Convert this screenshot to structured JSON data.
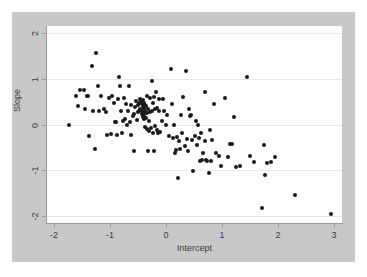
{
  "chart_data": {
    "type": "scatter",
    "title": "",
    "xlabel": "Intercept",
    "ylabel": "Slope",
    "xlim": [
      -2.15,
      3.15
    ],
    "ylim": [
      -2.15,
      2.15
    ],
    "xticks": [
      -2,
      -1,
      0,
      1,
      2,
      3
    ],
    "xticklabels": [
      "-2",
      "-1",
      "0",
      "1",
      "2",
      "3"
    ],
    "yticks": [
      2,
      1,
      0,
      -1,
      -2
    ],
    "yticklabels": [
      "2",
      "1",
      "0",
      "-1",
      "-2"
    ],
    "grid": "horizontal",
    "gridlines_y": [
      2,
      1,
      0,
      -1,
      -2
    ],
    "legend": "none",
    "marker": {
      "shape": "circle",
      "color": "#1a1a1a",
      "size": 4
    },
    "n_points": 158,
    "series": [
      {
        "name": "units",
        "points": [
          [
            -1.74,
            0.0
          ],
          [
            -1.62,
            0.62
          ],
          [
            -1.58,
            0.41
          ],
          [
            -1.55,
            0.76
          ],
          [
            -1.47,
            0.75
          ],
          [
            -1.45,
            0.33
          ],
          [
            -1.42,
            0.63
          ],
          [
            -1.4,
            0.62
          ],
          [
            -1.38,
            -0.26
          ],
          [
            -1.33,
            1.27
          ],
          [
            -1.3,
            0.3
          ],
          [
            -1.28,
            -0.53
          ],
          [
            -1.25,
            1.55
          ],
          [
            -1.22,
            0.85
          ],
          [
            -1.2,
            0.29
          ],
          [
            -1.16,
            0.63
          ],
          [
            -1.12,
            0.33
          ],
          [
            -1.08,
            0.28
          ],
          [
            -1.05,
            -0.23
          ],
          [
            -1.02,
            0.57
          ],
          [
            -0.99,
            -0.2
          ],
          [
            -0.96,
            0.62
          ],
          [
            -0.94,
            0.47
          ],
          [
            -0.92,
            0.06
          ],
          [
            -0.9,
            0.05
          ],
          [
            -0.88,
            -0.22
          ],
          [
            -0.86,
            0.55
          ],
          [
            -0.84,
            1.03
          ],
          [
            -0.82,
            0.84
          ],
          [
            -0.8,
            0.3
          ],
          [
            -0.79,
            -0.19
          ],
          [
            -0.77,
            0.08
          ],
          [
            -0.75,
            0.57
          ],
          [
            -0.74,
            0.12
          ],
          [
            -0.72,
            0.45
          ],
          [
            -0.7,
            0.0
          ],
          [
            -0.68,
            0.3
          ],
          [
            -0.66,
            0.83
          ],
          [
            -0.65,
            0.06
          ],
          [
            -0.63,
            0.42
          ],
          [
            -0.62,
            -0.24
          ],
          [
            -0.6,
            0.18
          ],
          [
            -0.58,
            -0.58
          ],
          [
            -0.57,
            0.22
          ],
          [
            -0.55,
            0.38
          ],
          [
            -0.54,
            0.52
          ],
          [
            -0.52,
            0.1
          ],
          [
            -0.51,
            0.27
          ],
          [
            -0.5,
            0.42
          ],
          [
            -0.49,
            0.3
          ],
          [
            -0.48,
            0.47
          ],
          [
            -0.47,
            0.55
          ],
          [
            -0.46,
            0.33
          ],
          [
            -0.45,
            0.51
          ],
          [
            -0.44,
            0.24
          ],
          [
            -0.43,
            0.44
          ],
          [
            -0.43,
            0.3
          ],
          [
            -0.42,
            0.17
          ],
          [
            -0.42,
            0.53
          ],
          [
            -0.41,
            0.38
          ],
          [
            -0.41,
            0.26
          ],
          [
            -0.4,
            0.48
          ],
          [
            -0.4,
            0.12
          ],
          [
            -0.39,
            0.35
          ],
          [
            -0.39,
            0.21
          ],
          [
            -0.38,
            0.43
          ],
          [
            -0.38,
            -0.05
          ],
          [
            -0.37,
            0.29
          ],
          [
            -0.36,
            0.15
          ],
          [
            -0.36,
            0.4
          ],
          [
            -0.35,
            -0.1
          ],
          [
            -0.34,
            0.25
          ],
          [
            -0.34,
            0.63
          ],
          [
            -0.33,
            -0.57
          ],
          [
            -0.32,
            0.34
          ],
          [
            -0.31,
            0.07
          ],
          [
            -0.3,
            -0.14
          ],
          [
            -0.29,
            0.58
          ],
          [
            -0.28,
            0.27
          ],
          [
            -0.27,
            -0.08
          ],
          [
            -0.26,
            0.95
          ],
          [
            -0.25,
            0.3
          ],
          [
            -0.24,
            -0.19
          ],
          [
            -0.23,
            0.46
          ],
          [
            -0.22,
            -0.58
          ],
          [
            -0.21,
            0.61
          ],
          [
            -0.2,
            -0.04
          ],
          [
            -0.19,
            0.33
          ],
          [
            -0.18,
            0.72
          ],
          [
            -0.17,
            -0.12
          ],
          [
            -0.16,
            0.35
          ],
          [
            -0.15,
            -0.18
          ],
          [
            -0.13,
            0.55
          ],
          [
            -0.12,
            0.29
          ],
          [
            -0.1,
            -0.16
          ],
          [
            -0.08,
            0.07
          ],
          [
            -0.05,
            0.56
          ],
          [
            -0.03,
            0.3
          ],
          [
            0.0,
            -0.01
          ],
          [
            0.02,
            0.2
          ],
          [
            0.05,
            -0.25
          ],
          [
            0.08,
            1.22
          ],
          [
            0.1,
            0.44
          ],
          [
            0.12,
            -0.3
          ],
          [
            0.14,
            0.0
          ],
          [
            0.16,
            -0.62
          ],
          [
            0.18,
            -0.56
          ],
          [
            0.2,
            -0.28
          ],
          [
            0.21,
            -1.17
          ],
          [
            0.23,
            -0.37
          ],
          [
            0.25,
            -0.54
          ],
          [
            0.27,
            0.2
          ],
          [
            0.29,
            -0.19
          ],
          [
            0.31,
            0.61
          ],
          [
            0.33,
            -0.48
          ],
          [
            0.35,
            1.17
          ],
          [
            0.37,
            -0.32
          ],
          [
            0.39,
            -0.57
          ],
          [
            0.41,
            0.33
          ],
          [
            0.43,
            0.18
          ],
          [
            0.45,
            0.21
          ],
          [
            0.47,
            -0.34
          ],
          [
            0.49,
            -1.02
          ],
          [
            0.51,
            -0.26
          ],
          [
            0.53,
            0.08
          ],
          [
            0.55,
            -0.44
          ],
          [
            0.57,
            0.0
          ],
          [
            0.59,
            -0.29
          ],
          [
            0.61,
            -0.8
          ],
          [
            0.63,
            -0.18
          ],
          [
            0.65,
            -0.78
          ],
          [
            0.67,
            -0.62
          ],
          [
            0.69,
            -0.35
          ],
          [
            0.7,
            0.7
          ],
          [
            0.72,
            -0.77
          ],
          [
            0.74,
            -0.79
          ],
          [
            0.76,
            -1.06
          ],
          [
            0.78,
            -0.12
          ],
          [
            0.8,
            -0.8
          ],
          [
            0.82,
            -0.34
          ],
          [
            0.86,
            0.45
          ],
          [
            0.9,
            -0.62
          ],
          [
            0.95,
            -0.68
          ],
          [
            0.99,
            -0.9
          ],
          [
            1.05,
            0.58
          ],
          [
            1.1,
            -0.72
          ],
          [
            1.15,
            -0.42
          ],
          [
            1.18,
            -0.43
          ],
          [
            1.22,
            0.17
          ],
          [
            1.25,
            -0.92
          ],
          [
            1.32,
            -0.9
          ],
          [
            1.45,
            1.03
          ],
          [
            1.5,
            -0.68
          ],
          [
            1.58,
            -0.82
          ],
          [
            1.72,
            -1.82
          ],
          [
            1.75,
            -0.45
          ],
          [
            1.77,
            -1.1
          ],
          [
            1.8,
            -0.85
          ],
          [
            1.88,
            -0.82
          ],
          [
            1.95,
            -0.7
          ],
          [
            2.3,
            -1.53
          ],
          [
            2.95,
            -1.95
          ]
        ]
      }
    ]
  }
}
